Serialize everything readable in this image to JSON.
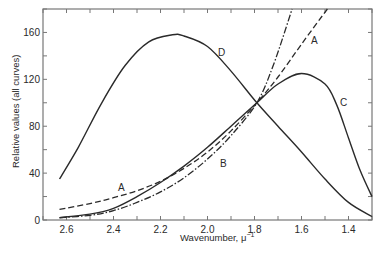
{
  "chart_data": {
    "type": "line",
    "title": "",
    "xlabel": "Wavenumber, μ⁻¹",
    "ylabel": "Relative values (all curves)",
    "xlim": [
      2.7,
      1.3
    ],
    "ylim": [
      0,
      180
    ],
    "x_reversed": true,
    "x_ticks": [
      2.6,
      2.4,
      2.2,
      2.0,
      1.8,
      1.6,
      1.4
    ],
    "x_tick_labels": [
      "2.6",
      "2.4",
      "2.2",
      "2.0",
      "1.8",
      "1.6",
      "1.4"
    ],
    "y_ticks": [
      0,
      40,
      80,
      120,
      160
    ],
    "y_tick_labels": [
      "0",
      "40",
      "80",
      "120",
      "160"
    ],
    "grid": false,
    "legend": "inline curve labels",
    "series": [
      {
        "name": "A",
        "style": "dashed",
        "x": [
          2.63,
          2.5,
          2.4,
          2.3,
          2.2,
          2.1,
          2.0,
          1.9,
          1.79,
          1.7,
          1.6,
          1.49
        ],
        "y": [
          9,
          14,
          19,
          25,
          33,
          44,
          58,
          76,
          100,
          122,
          150,
          180
        ]
      },
      {
        "name": "B",
        "style": "dash-dot",
        "x": [
          2.63,
          2.5,
          2.4,
          2.3,
          2.2,
          2.1,
          2.0,
          1.9,
          1.79,
          1.72,
          1.64
        ],
        "y": [
          2,
          4,
          8,
          15,
          24,
          36,
          52,
          72,
          100,
          132,
          180
        ]
      },
      {
        "name": "C",
        "style": "solid",
        "x": [
          2.63,
          2.5,
          2.4,
          2.3,
          2.2,
          2.1,
          2.0,
          1.9,
          1.79,
          1.7,
          1.6,
          1.5,
          1.45,
          1.4,
          1.35,
          1.3
        ],
        "y": [
          2,
          5,
          10,
          20,
          32,
          46,
          62,
          80,
          100,
          116,
          125,
          116,
          98,
          70,
          42,
          20
        ]
      },
      {
        "name": "D",
        "style": "solid",
        "x": [
          2.63,
          2.55,
          2.45,
          2.35,
          2.25,
          2.15,
          2.1,
          2.0,
          1.9,
          1.79,
          1.7,
          1.6,
          1.5,
          1.4,
          1.3
        ],
        "y": [
          35,
          62,
          100,
          132,
          152,
          158,
          157,
          148,
          127,
          100,
          80,
          58,
          35,
          15,
          3
        ]
      }
    ],
    "annotations": [
      {
        "text": "A",
        "near_series": "A",
        "x": 1.49,
        "y": 148
      },
      {
        "text": "A",
        "near_series": "A",
        "x": 2.43,
        "y": 24
      },
      {
        "text": "B",
        "near_series": "B",
        "x": 1.93,
        "y": 62
      },
      {
        "text": "C",
        "near_series": "C",
        "x": 1.42,
        "y": 100
      },
      {
        "text": "D",
        "near_series": "D",
        "x": 1.99,
        "y": 150
      }
    ]
  },
  "labels": {
    "xlabel": "Wavenumber, μ",
    "xlabel_sup": "−1",
    "ylabel": "Relative values (all curves)",
    "curve_A_top": "A",
    "curve_A_bottom": "A",
    "curve_B": "B",
    "curve_C": "C",
    "curve_D": "D"
  },
  "colors": {
    "ink": "#2a2a2a",
    "frame": "#777777",
    "background": "#ffffff"
  }
}
